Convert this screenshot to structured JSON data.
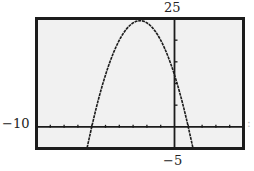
{
  "window": {
    "xmin_label": "−10",
    "xmax_label": ":",
    "ymax_label": "25",
    "ymin_label": "−5"
  },
  "colors": {
    "screen_bg": "#f1f1f1",
    "frame": "#1c1c1c",
    "curve": "#1c1c1c",
    "axes": "#1c1c1c"
  },
  "chart_data": {
    "type": "line",
    "title": "",
    "xlabel": "",
    "ylabel": "",
    "xlim": [
      -10,
      5
    ],
    "ylim": [
      -5,
      25
    ],
    "xscl": 1,
    "yscl": 5,
    "grid": false,
    "legend": "none",
    "function": "y = -2x^2 - 10x + 12",
    "series": [
      {
        "name": "parabola",
        "x": [
          -6.8,
          -6,
          -5,
          -4,
          -3,
          -2.5,
          -2,
          -1,
          0,
          1,
          1.5
        ],
        "values": [
          -10.9,
          0,
          12,
          20,
          24,
          24.5,
          24,
          20,
          12,
          0,
          -7.5
        ]
      }
    ],
    "annotations": {
      "vertex": [
        -2.5,
        24.5
      ],
      "x_intercepts": [
        -6,
        1
      ],
      "y_intercept": 12
    }
  }
}
